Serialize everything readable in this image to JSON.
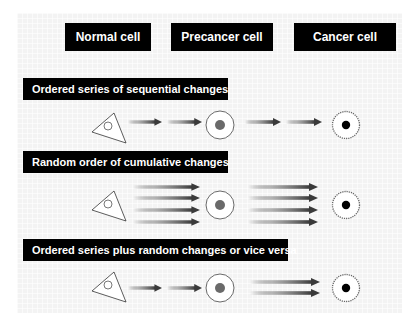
{
  "header": {
    "columns": [
      {
        "label": "Normal cell"
      },
      {
        "label": "Precancer cell"
      },
      {
        "label": "Cancer cell"
      }
    ]
  },
  "sections": [
    {
      "title": "Ordered series of sequential changes",
      "arrows_stage1": 2,
      "arrows_stage2": 2,
      "arrangement": "sequential-sequential"
    },
    {
      "title": "Random order of cumulative changes",
      "arrows_stage1": 4,
      "arrows_stage2": 4,
      "arrangement": "parallel-parallel"
    },
    {
      "title": "Ordered series plus random changes or vice versa",
      "arrows_stage1": 2,
      "arrows_stage2": 2,
      "arrangement": "sequential-parallel"
    }
  ],
  "colors": {
    "label_bg": "#000000",
    "label_text": "#ffffff",
    "panel_bg": "#f3f3f3",
    "arrow_dark": "#3a3a3a",
    "precancer_nucleus": "#6a6a6a",
    "cancer_nucleus": "#000000"
  },
  "icons": {
    "normal_cell": "triangle-cell-icon",
    "precancer_cell": "round-cell-gray-nucleus-icon",
    "cancer_cell": "serrated-cell-black-nucleus-icon",
    "arrow": "gradient-arrow-icon"
  }
}
